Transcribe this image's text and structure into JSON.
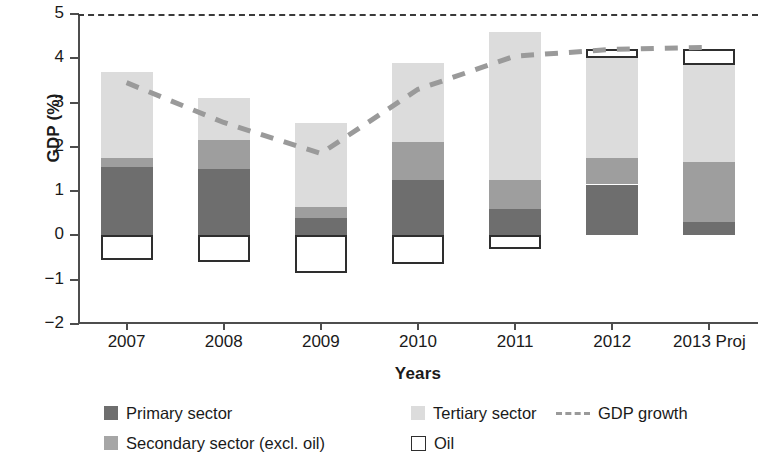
{
  "chart_data": {
    "type": "bar",
    "title": "",
    "xlabel": "Years",
    "ylabel": "GDP (%)",
    "categories": [
      "2007",
      "2008",
      "2009",
      "2010",
      "2011",
      "2012",
      "2013 Proj"
    ],
    "ylim": [
      -2,
      5
    ],
    "yticks": [
      5,
      4,
      3,
      2,
      1,
      0,
      -1,
      -2
    ],
    "ytick_labels": [
      "5",
      "4",
      "3",
      "2",
      "1",
      "0",
      "−1",
      "−2"
    ],
    "grid": false,
    "stacked": true,
    "legend_position": "bottom",
    "series": [
      {
        "name": "Primary sector",
        "type": "bar",
        "color": "#6e6e6e",
        "values": [
          1.55,
          1.5,
          0.4,
          1.25,
          0.6,
          1.15,
          0.3
        ]
      },
      {
        "name": "Secondary sector (excl. oil)",
        "type": "bar",
        "color": "#9e9e9e",
        "values": [
          0.2,
          0.65,
          0.25,
          0.85,
          0.65,
          0.6,
          1.35
        ]
      },
      {
        "name": "Tertiary sector",
        "type": "bar",
        "color": "#dcdcdc",
        "values": [
          1.95,
          0.95,
          1.9,
          1.8,
          3.35,
          2.25,
          2.2
        ]
      },
      {
        "name": "Oil",
        "type": "bar",
        "color": "#ffffff",
        "values": [
          -0.55,
          -0.6,
          -0.85,
          -0.65,
          -0.3,
          0.2,
          0.35
        ]
      },
      {
        "name": "GDP growth",
        "type": "line",
        "color": "#9a9a9a",
        "style": "dashed",
        "values": [
          3.45,
          2.55,
          1.85,
          3.3,
          4.05,
          4.2,
          4.25
        ]
      }
    ],
    "bar_totals_positive": [
      3.7,
      3.1,
      2.55,
      3.9,
      4.6,
      4.2,
      4.15
    ],
    "legend_entries": [
      "Primary sector",
      "Secondary sector (excl. oil)",
      "Tertiary sector",
      "Oil",
      "GDP growth"
    ]
  },
  "axes": {
    "ylabel": "GDP (%)",
    "xlabel": "Years"
  },
  "legend": {
    "primary": "Primary sector",
    "secondary": "Secondary sector (excl. oil)",
    "tertiary": "Tertiary sector",
    "oil": "Oil",
    "growth": "GDP growth"
  }
}
